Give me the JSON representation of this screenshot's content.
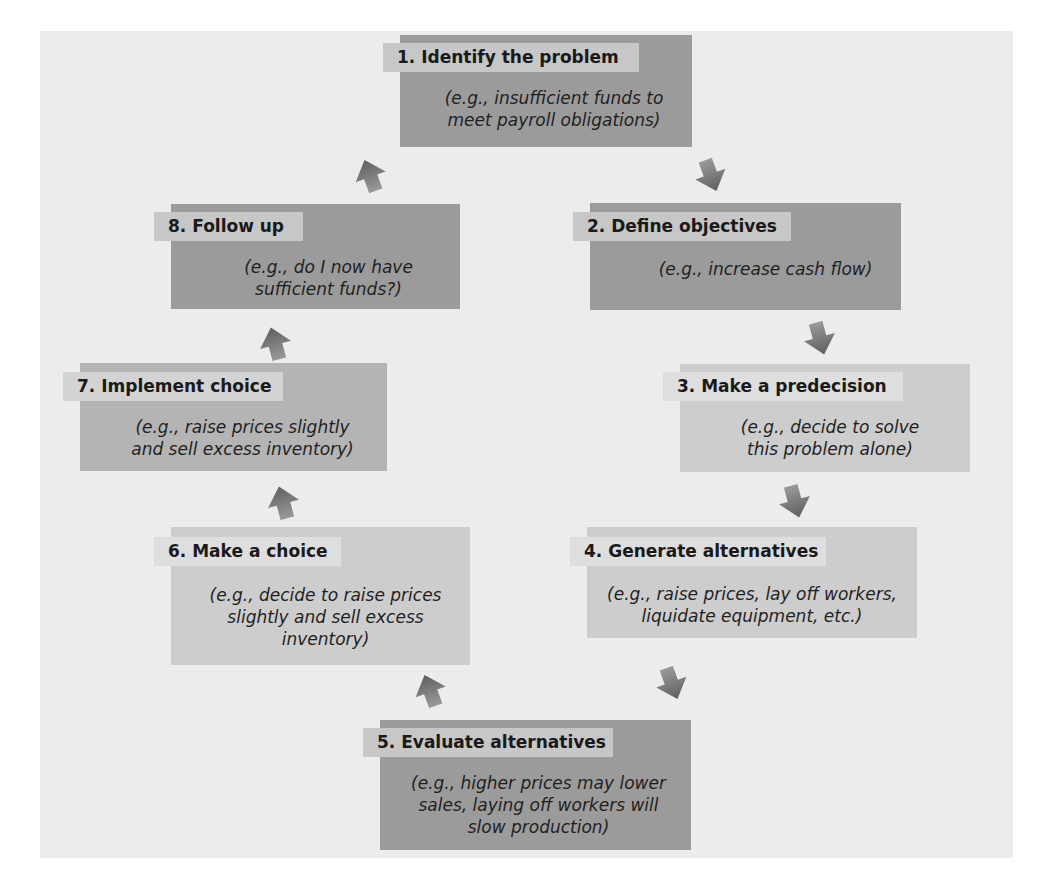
{
  "diagram": {
    "type": "cycle",
    "steps": [
      {
        "number": "1",
        "title": "1. Identify the problem",
        "example_lines": [
          "(e.g., insufficient funds to",
          "meet payroll obligations)"
        ]
      },
      {
        "number": "2",
        "title": "2. Define objectives",
        "example_lines": [
          "(e.g., increase cash flow)"
        ]
      },
      {
        "number": "3",
        "title": "3. Make a predecision",
        "example_lines": [
          "(e.g., decide to solve",
          "this problem alone)"
        ]
      },
      {
        "number": "4",
        "title": "4. Generate alternatives",
        "example_lines": [
          "(e.g., raise prices, lay off workers,",
          "liquidate equipment, etc.)"
        ]
      },
      {
        "number": "5",
        "title": "5. Evaluate alternatives",
        "example_lines": [
          "(e.g., higher prices may lower",
          "sales, laying off workers will",
          "slow production)"
        ]
      },
      {
        "number": "6",
        "title": "6. Make a choice",
        "example_lines": [
          "(e.g., decide to raise prices",
          "slightly and sell excess",
          "inventory)"
        ]
      },
      {
        "number": "7",
        "title": "7. Implement choice",
        "example_lines": [
          "(e.g., raise prices slightly",
          "and sell excess inventory)"
        ]
      },
      {
        "number": "8",
        "title": "8. Follow up",
        "example_lines": [
          "(e.g., do I now have",
          "sufficient funds?)"
        ]
      }
    ],
    "arrows": [
      {
        "from": "1",
        "to": "2",
        "icon": "arrow-down-icon"
      },
      {
        "from": "2",
        "to": "3",
        "icon": "arrow-down-icon"
      },
      {
        "from": "3",
        "to": "4",
        "icon": "arrow-down-icon"
      },
      {
        "from": "4",
        "to": "5",
        "icon": "arrow-down-icon"
      },
      {
        "from": "5",
        "to": "6",
        "icon": "arrow-up-icon"
      },
      {
        "from": "6",
        "to": "7",
        "icon": "arrow-up-icon"
      },
      {
        "from": "7",
        "to": "8",
        "icon": "arrow-up-icon"
      },
      {
        "from": "8",
        "to": "1",
        "icon": "arrow-up-icon"
      }
    ],
    "colors": {
      "background_panel": "#ececec",
      "box_dark": "#9b9b9b",
      "box_mid": "#b4b4b4",
      "box_light": "#cdcdcd",
      "arrow": "#6f6f6f"
    }
  }
}
